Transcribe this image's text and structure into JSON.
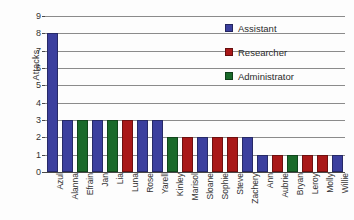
{
  "chart_data": {
    "type": "bar",
    "title": "",
    "subtitle": "",
    "xlabel": "",
    "ylabel": "Attacks",
    "ylim": [
      0,
      9
    ],
    "yticks": [
      0,
      1,
      2,
      3,
      4,
      5,
      6,
      7,
      8,
      9
    ],
    "grid": true,
    "legend_position": "top-right",
    "categories": [
      "Azul",
      "Alanna",
      "Efrain",
      "Jan",
      "Lia",
      "Luna",
      "Rose",
      "Yarell",
      "Kinley",
      "Marisol",
      "Sloane",
      "Sophie",
      "Steve",
      "Zachery",
      "Ann",
      "Aubrie",
      "Bryan",
      "Leroy",
      "Molly",
      "Willie"
    ],
    "values": [
      8,
      3,
      3,
      3,
      3,
      3,
      3,
      3,
      2,
      2,
      2,
      2,
      2,
      2,
      1,
      1,
      1,
      1,
      1,
      1
    ],
    "groups": [
      "Assistant",
      "Assistant",
      "Administrator",
      "Assistant",
      "Administrator",
      "Researcher",
      "Assistant",
      "Assistant",
      "Administrator",
      "Researcher",
      "Assistant",
      "Researcher",
      "Researcher",
      "Assistant",
      "Assistant",
      "Researcher",
      "Administrator",
      "Researcher",
      "Researcher",
      "Assistant"
    ],
    "legend": [
      {
        "label": "Assistant",
        "color": "#3b3f9e"
      },
      {
        "label": "Researcher",
        "color": "#a91818"
      },
      {
        "label": "Administrator",
        "color": "#1a6a2a"
      }
    ],
    "colors": {
      "Assistant": "#3b3f9e",
      "Researcher": "#a91818",
      "Administrator": "#1a6a2a"
    }
  }
}
